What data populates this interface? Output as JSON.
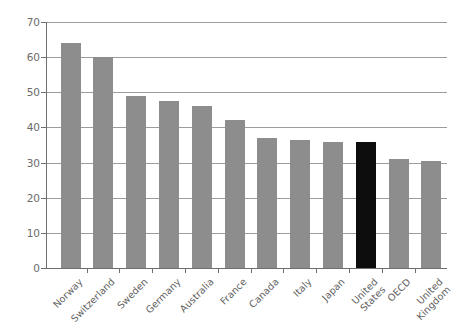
{
  "chart_data": {
    "type": "bar",
    "title": "",
    "subtitle": "",
    "xlabel": "",
    "ylabel": "U.S. Dollars",
    "ylim": [
      0,
      70
    ],
    "ytick_step": 10,
    "yticks": [
      "70",
      "60",
      "50",
      "40",
      "30",
      "20",
      "10",
      "0"
    ],
    "grid": "horizontal",
    "legend": "none",
    "categories": [
      "Norway",
      "Switzerland",
      "Sweden",
      "Germany",
      "Australia",
      "France",
      "Canada",
      "Italy",
      "Japan",
      "United\nStates",
      "OECD",
      "United\nKingdom"
    ],
    "values": [
      64,
      60,
      49,
      47.5,
      46,
      42,
      37,
      36.5,
      36,
      36,
      31,
      30.5
    ],
    "highlight_index": 9,
    "colors": {
      "bar": "#8d8d8d",
      "highlight_bar": "#0d0d0d",
      "gridline": "#9c9c9c",
      "axis": "#6f6f6f",
      "text": "#5f5f5f",
      "background": "#ffffff"
    }
  }
}
